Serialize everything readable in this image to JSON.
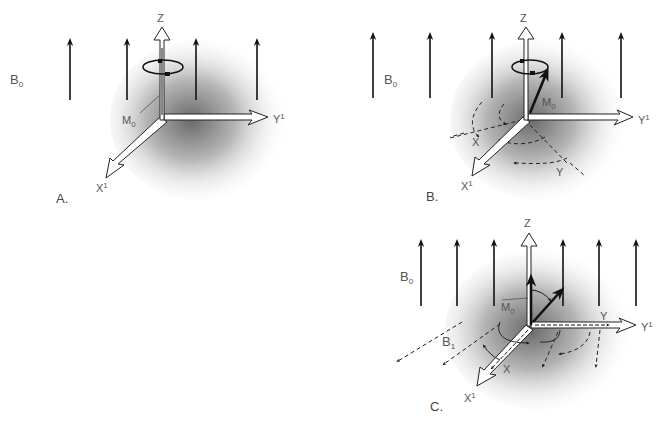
{
  "figure": {
    "colors": {
      "field_arrow": "#111111",
      "axis_fill": "#ffffff",
      "axis_stroke": "#222222",
      "label": "#555555",
      "shadow": "#777777"
    },
    "panels": [
      {
        "id": "A",
        "letter": "A.",
        "field_label": "B",
        "field_sub": "0",
        "axis_z": "Z",
        "axis_y": "Y",
        "axis_y_sup": "1",
        "axis_x": "X",
        "axis_x_sup": "1",
        "magnetization_label": "M",
        "magnetization_sub": "0",
        "field_arrow_count": 4
      },
      {
        "id": "B",
        "letter": "B.",
        "field_label": "B",
        "field_sub": "0",
        "axis_z": "Z",
        "axis_y": "Y",
        "axis_y_sup": "1",
        "axis_x": "X",
        "axis_x_sup": "1",
        "magnetization_label": "M",
        "magnetization_sub": "0",
        "rotating_x": "X",
        "rotating_y": "Y",
        "field_arrow_count": 5
      },
      {
        "id": "C",
        "letter": "C.",
        "field_label": "B",
        "field_sub": "0",
        "axis_z": "Z",
        "axis_y": "Y",
        "axis_y_sup": "1",
        "axis_x": "X",
        "axis_x_sup": "1",
        "magnetization_label": "M",
        "magnetization_sub": "0",
        "rf_field_label": "B",
        "rf_field_sub": "1",
        "rotating_x": "X",
        "rotating_y": "Y",
        "field_arrow_count": 7
      }
    ]
  }
}
